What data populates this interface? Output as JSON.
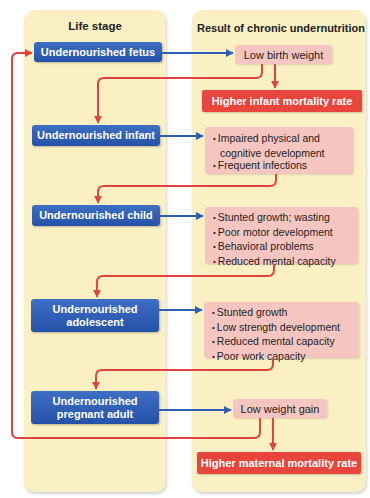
{
  "columns": {
    "life_stage_title": "Life stage",
    "result_title": "Result of chronic undernutrition"
  },
  "stages": [
    {
      "label": "Undernourished fetus"
    },
    {
      "label": "Undernourished infant"
    },
    {
      "label": "Undernourished child"
    },
    {
      "label": "Undernourished adolescent"
    },
    {
      "label": "Undernourished pregnant adult"
    }
  ],
  "results": {
    "fetus": "Low birth weight",
    "infant": [
      "Impaired physical and cognitive development",
      "Frequent infections"
    ],
    "child": [
      "Stunted growth; wasting",
      "Poor motor development",
      "Behavioral problems",
      "Reduced mental capacity"
    ],
    "adolescent": [
      "Stunted growth",
      "Low strength development",
      "Reduced mental capacity",
      "Poor work capacity"
    ],
    "pregnant_adult": "Low weight gain"
  },
  "mortality": {
    "infant": "Higher infant mortality rate",
    "maternal": "Higher maternal mortality rate"
  },
  "colors": {
    "panel": "#faf0c4",
    "stage_box": "#2f5fb5",
    "result_box": "#f5c6c0",
    "mortality_box": "#e8453c",
    "blue_arrow": "#2f5fb5",
    "red_arrow": "#e0443c"
  }
}
